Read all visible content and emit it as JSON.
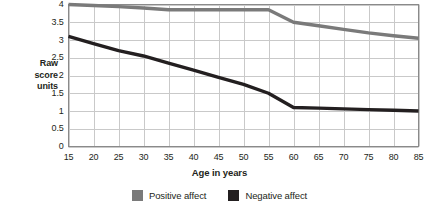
{
  "chart_data": {
    "type": "line",
    "title": "",
    "xlabel": "Age in years",
    "ylabel": "Raw score units",
    "ylabel_lines": [
      "Raw",
      "score",
      "units"
    ],
    "x": [
      15,
      20,
      25,
      30,
      35,
      40,
      45,
      50,
      55,
      60,
      65,
      70,
      75,
      80,
      85
    ],
    "xlim": [
      15,
      85
    ],
    "ylim": [
      0,
      4
    ],
    "x_ticks": [
      "15",
      "20",
      "25",
      "30",
      "35",
      "40",
      "45",
      "50",
      "55",
      "60",
      "65",
      "70",
      "75",
      "80",
      "85"
    ],
    "y_ticks": [
      "0",
      "0.5",
      "1",
      "1.5",
      "2",
      "2.5",
      "3",
      "3.5",
      "4"
    ],
    "grid": true,
    "legend_position": "bottom",
    "series": [
      {
        "name": "Positive affect",
        "color": "#7a7a7a",
        "values": [
          4.0,
          3.97,
          3.94,
          3.9,
          3.85,
          3.85,
          3.85,
          3.85,
          3.85,
          3.5,
          3.4,
          3.3,
          3.2,
          3.12,
          3.05
        ]
      },
      {
        "name": "Negative affect",
        "color": "#231f20",
        "values": [
          3.1,
          2.9,
          2.7,
          2.55,
          2.35,
          2.15,
          1.95,
          1.75,
          1.5,
          1.1,
          1.08,
          1.06,
          1.04,
          1.02,
          1.0
        ]
      }
    ]
  },
  "legend": {
    "items": [
      {
        "label": "Positive affect",
        "color": "#7a7a7a",
        "swatch_name": "legend-swatch-positive-affect"
      },
      {
        "label": "Negative affect",
        "color": "#231f20",
        "swatch_name": "legend-swatch-negative-affect"
      }
    ]
  },
  "axes": {
    "y_title_line1": "Raw",
    "y_title_line2": "score",
    "y_title_line3": "units",
    "x_title": "Age in years"
  },
  "colors": {
    "positive_affect": "#7a7a7a",
    "negative_affect": "#231f20",
    "grid": "#c9c9c9",
    "axis": "#8a8a8a",
    "background": "#ffffff"
  }
}
